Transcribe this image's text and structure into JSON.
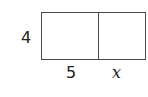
{
  "diagram": {
    "type": "area-model-rectangle",
    "height_label": "4",
    "parts": [
      {
        "width_label": "5"
      },
      {
        "width_label": "x"
      }
    ],
    "colors": {
      "stroke": "#4a4a4a",
      "fill": "#ffffff",
      "text": "#222222"
    }
  }
}
